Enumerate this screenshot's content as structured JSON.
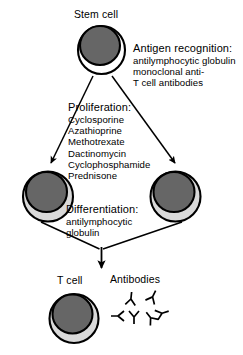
{
  "diagram": {
    "colors": {
      "cell_fill": "#666666",
      "cell_rim": "#d9d9d9",
      "outline": "#000000",
      "background": "#ffffff",
      "text": "#000000"
    }
  },
  "nodes": {
    "stem_cell": {
      "label": "Stem cell"
    },
    "t_cell": {
      "label": "T cell"
    },
    "antibodies": {
      "label": "Antibodies"
    }
  },
  "annotations": {
    "antigen_recognition": {
      "title": "Antigen recognition:",
      "lines": [
        "antilymphocytic globulin",
        "monoclonal anti-",
        "T cell antibodies"
      ]
    },
    "proliferation": {
      "title": "Proliferation:",
      "lines": [
        "Cyclosporine",
        "Azathioprine",
        "Methotrexate",
        "Dactinomycin",
        "Cyclophosphamide",
        "Prednisone"
      ]
    },
    "differentiation": {
      "title": "Differentiation:",
      "lines": [
        "antilymphocytic",
        "globulin"
      ]
    }
  }
}
